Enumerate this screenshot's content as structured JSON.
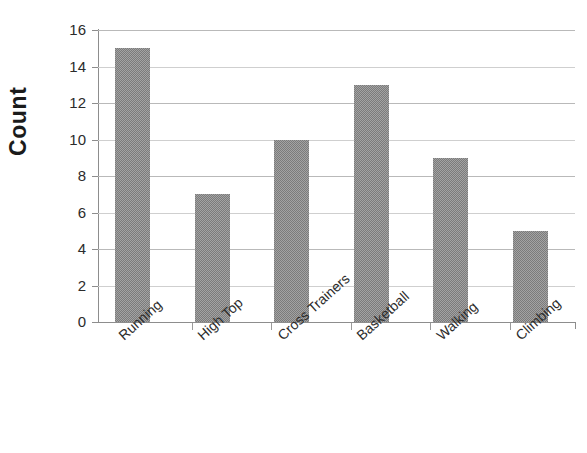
{
  "chart_data": {
    "type": "bar",
    "title": "",
    "xlabel": "",
    "ylabel": "Count",
    "categories": [
      "Running",
      "High Top",
      "Cross Trainers",
      "Basketball",
      "Walking",
      "Climbing"
    ],
    "values": [
      15,
      7,
      10,
      13,
      9,
      5
    ],
    "ylim": [
      0,
      16
    ],
    "ytick_labels": [
      "16",
      "14",
      "12",
      "10",
      "8",
      "6",
      "4",
      "2",
      "0"
    ],
    "ytick_values": [
      16,
      14,
      12,
      10,
      8,
      6,
      4,
      2,
      0
    ],
    "grid": true,
    "grid_axis": "y",
    "legend": false,
    "legend_position": "none",
    "bar_color": "#7b7b7b",
    "gridline_color": "#b9b9b9",
    "axis_color": "#8d8d8d",
    "text_color": "#2b2b2b",
    "background_color": "#ffffff",
    "xtick_label_rotation": -42
  },
  "axes": {
    "y_title": "Count"
  }
}
